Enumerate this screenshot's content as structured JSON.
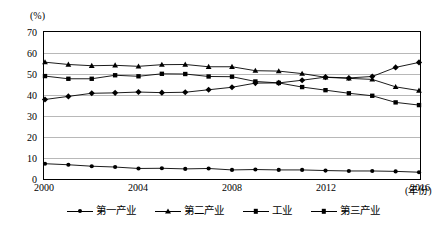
{
  "axis_unit_label": "(%)",
  "x_axis_name": "(年份)",
  "y_ticks": [
    "0",
    "10",
    "20",
    "30",
    "40",
    "50",
    "60",
    "70"
  ],
  "x_ticks": [
    "2000",
    "2004",
    "2008",
    "2012",
    "2016"
  ],
  "legend": {
    "items": [
      {
        "label": "第一产业",
        "marker": "dot"
      },
      {
        "label": "第二产业",
        "marker": "triangle"
      },
      {
        "label": "工业",
        "marker": "square"
      },
      {
        "label": "第三产业",
        "marker": "diamond"
      }
    ]
  },
  "chart_data": {
    "type": "line",
    "title": "",
    "xlabel": "(年份)",
    "ylabel": "(%)",
    "xlim": [
      2000,
      2016
    ],
    "ylim": [
      0,
      70
    ],
    "grid": true,
    "legend_position": "bottom",
    "x": [
      2000,
      2001,
      2002,
      2003,
      2004,
      2005,
      2006,
      2007,
      2008,
      2009,
      2010,
      2011,
      2012,
      2013,
      2014,
      2015,
      2016
    ],
    "series": [
      {
        "name": "第一产业",
        "marker": "dot",
        "color": "#000000",
        "values": [
          6.9,
          6.4,
          5.7,
          5.3,
          4.6,
          4.7,
          4.4,
          4.6,
          3.9,
          4.1,
          3.9,
          3.9,
          3.6,
          3.4,
          3.4,
          3.2,
          2.8
        ]
      },
      {
        "name": "第二产业",
        "marker": "triangle",
        "color": "#000000",
        "values": [
          55.9,
          54.8,
          54.2,
          54.4,
          53.9,
          54.7,
          54.8,
          53.7,
          53.7,
          51.8,
          51.6,
          50.4,
          48.6,
          48.1,
          47.6,
          44.0,
          42.2
        ]
      },
      {
        "name": "工业",
        "marker": "square",
        "color": "#000000",
        "values": [
          49.2,
          47.9,
          47.9,
          49.6,
          49.1,
          50.3,
          50.2,
          49.0,
          48.9,
          46.6,
          45.9,
          43.9,
          42.4,
          40.9,
          39.7,
          36.5,
          35.2
        ]
      },
      {
        "name": "第三产业",
        "marker": "diamond",
        "color": "#000000",
        "values": [
          37.9,
          39.4,
          40.9,
          41.1,
          41.5,
          41.2,
          41.4,
          42.6,
          43.8,
          45.8,
          45.9,
          47.2,
          48.7,
          48.3,
          49.0,
          53.4,
          55.8
        ]
      }
    ]
  }
}
